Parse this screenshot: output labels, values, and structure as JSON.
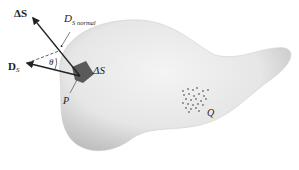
{
  "diagram": {
    "labels": {
      "delta_s_vector": "ΔS",
      "ds_normal_main": "D",
      "ds_normal_sub": "S normal",
      "ds_vector_main": "D",
      "ds_vector_sub": "S",
      "theta": "θ",
      "delta_s_patch": "ΔS",
      "point_p": "P",
      "charge_q": "Q"
    },
    "colors": {
      "surface_light": "#f2f2f2",
      "surface_dark": "#bdbdbd",
      "patch": "#5a5a5a",
      "ink": "#222222"
    }
  }
}
